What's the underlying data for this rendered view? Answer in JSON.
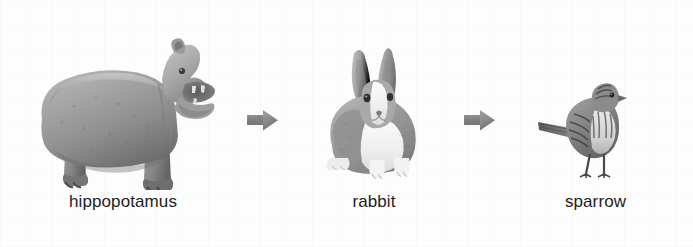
{
  "page": {
    "type": "animal-size-sequence",
    "background_color": "#fdfdfd",
    "text_color": "#1e1e1e",
    "arrow_color": "#8c8c8c"
  },
  "sequence": {
    "items": [
      {
        "id": "hippopotamus",
        "label": "hippopotamus",
        "image_name": "hippopotamus-photo",
        "image_alt": "grayscale photograph of a hippopotamus standing in profile facing right with its mouth open wide"
      },
      {
        "id": "rabbit",
        "label": "rabbit",
        "image_name": "rabbit-photo",
        "image_alt": "grayscale photograph of a rabbit sitting facing forward with long upright ears"
      },
      {
        "id": "sparrow",
        "label": "sparrow",
        "image_name": "sparrow-photo",
        "image_alt": "grayscale photograph of a streaked sparrow standing with tail pointed left"
      }
    ],
    "arrows": [
      {
        "id": "arrow-1",
        "icon": "right-arrow-icon",
        "direction": "right"
      },
      {
        "id": "arrow-2",
        "icon": "right-arrow-icon",
        "direction": "right"
      }
    ]
  }
}
